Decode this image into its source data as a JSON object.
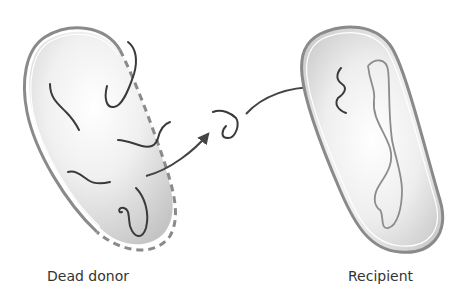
{
  "labels": {
    "donor": "Dead donor",
    "recipient": "Recipient"
  },
  "colors": {
    "cell_outline": "#8a8a8a",
    "cell_fill_light": "#f4f4f4",
    "cell_fill_dark": "#c8c8c8",
    "dna_strand": "#3a3a3a",
    "chromosome": "#8c8c8c",
    "arrow": "#444444",
    "text": "#333333"
  },
  "elements": {
    "donor_cell": {
      "state": "ruptured (dashed membrane on right side)",
      "dna_fragments": 6
    },
    "free_dna_fragment": {
      "count": 1
    },
    "arrows": {
      "count": 2
    },
    "recipient_cell": {
      "chromosome": "twisted loop",
      "incoming_fragment": 1
    }
  }
}
